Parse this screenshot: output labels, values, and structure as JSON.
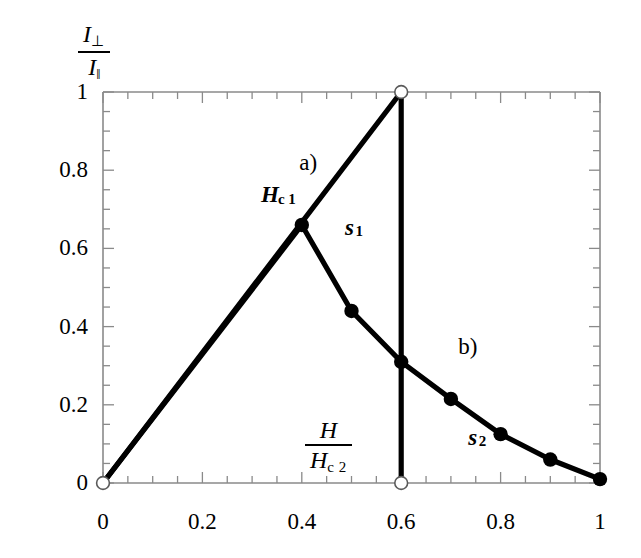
{
  "figure": {
    "axis_color": "#8a8a8a",
    "curve_color": "#000000",
    "background": "#ffffff"
  },
  "yaxis_label": {
    "numerator_symbol": "I",
    "numerator_sub": "⊥",
    "denominator_symbol": "I",
    "denominator_sub": "‖"
  },
  "xaxis_label": {
    "numerator_symbol": "H",
    "denominator_symbol": "H",
    "denominator_sub": "c 2"
  },
  "annotations": [
    {
      "name": "curve-a-label",
      "text": "a)",
      "x": 0.395,
      "y": 0.815
    },
    {
      "name": "curve-b-label",
      "text": "b)",
      "x": 0.715,
      "y": 0.345
    },
    {
      "name": "hc1-label-main",
      "text": "H",
      "x": 0.318,
      "y": 0.735
    },
    {
      "name": "hc1-label-sub",
      "text": "c 1",
      "x": 0.352,
      "y": 0.712
    },
    {
      "name": "s1-label-main",
      "text": "s",
      "x": 0.487,
      "y": 0.65
    },
    {
      "name": "s1-label-sub",
      "text": "1",
      "x": 0.508,
      "y": 0.628
    },
    {
      "name": "s2-label-main",
      "text": "s",
      "x": 0.735,
      "y": 0.113
    },
    {
      "name": "s2-label-sub",
      "text": "2",
      "x": 0.756,
      "y": 0.092
    }
  ],
  "chart_data": {
    "type": "line",
    "title": "",
    "xlabel": "H / H_c2",
    "ylabel": "I_perp / I_parallel",
    "xlim": [
      0,
      1
    ],
    "ylim": [
      0,
      1
    ],
    "grid": false,
    "legend": "none",
    "xticks": [
      "0",
      "0.2",
      "0.4",
      "0.6",
      "0.8",
      "1"
    ],
    "xtick_values": [
      0,
      0.2,
      0.4,
      0.6,
      0.8,
      1
    ],
    "yticks": [
      "0",
      "0.2",
      "0.4",
      "0.6",
      "0.8",
      "1"
    ],
    "ytick_values": [
      0,
      0.2,
      0.4,
      0.6,
      0.8,
      1
    ],
    "minor_tick_step": 0.05,
    "series": [
      {
        "name": "a",
        "label": "a)",
        "style": "solid-thick",
        "x": [
          0,
          0.6
        ],
        "y": [
          0,
          1
        ]
      },
      {
        "name": "a-drop",
        "label": "",
        "style": "solid-thick-vertical",
        "x": [
          0.6,
          0.6
        ],
        "y": [
          1,
          0
        ]
      },
      {
        "name": "b",
        "label": "b)",
        "style": "solid-thick-markers",
        "x": [
          0,
          0.4,
          0.5,
          0.6,
          0.7,
          0.8,
          0.9,
          1.0
        ],
        "y": [
          0,
          0.66,
          0.44,
          0.31,
          0.215,
          0.125,
          0.06,
          0.01
        ]
      }
    ],
    "filled_markers": [
      {
        "x": 0.4,
        "y": 0.66,
        "note": "Hc1"
      },
      {
        "x": 0.5,
        "y": 0.44
      },
      {
        "x": 0.6,
        "y": 0.31
      },
      {
        "x": 0.7,
        "y": 0.215
      },
      {
        "x": 0.8,
        "y": 0.125
      },
      {
        "x": 0.9,
        "y": 0.06
      },
      {
        "x": 1.0,
        "y": 0.01
      }
    ],
    "open_markers": [
      {
        "x": 0.0,
        "y": 0.0
      },
      {
        "x": 0.6,
        "y": 1.0
      },
      {
        "x": 0.6,
        "y": 0.0
      }
    ]
  }
}
